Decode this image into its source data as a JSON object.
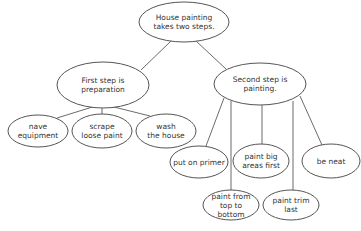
{
  "diagram": {
    "type": "concept-map",
    "colors": {
      "stroke": "#555555",
      "text": "#333333",
      "background": "#ffffff"
    },
    "nodes": [
      {
        "id": "root",
        "label": "House painting\ntakes two steps.",
        "cx": 184,
        "cy": 22,
        "rx": 45,
        "ry": 20
      },
      {
        "id": "prep",
        "label": "First step is preparation",
        "cx": 103,
        "cy": 85,
        "rx": 46,
        "ry": 23
      },
      {
        "id": "paint",
        "label": "Second step is painting.",
        "cx": 260,
        "cy": 84,
        "rx": 46,
        "ry": 21
      },
      {
        "id": "equip",
        "label": "nave\nequipment",
        "cx": 38,
        "cy": 131,
        "rx": 30,
        "ry": 16
      },
      {
        "id": "scrape",
        "label": "scrape\nloose paint",
        "cx": 102,
        "cy": 131,
        "rx": 30,
        "ry": 17
      },
      {
        "id": "wash",
        "label": "wash\nthe house",
        "cx": 166,
        "cy": 131,
        "rx": 30,
        "ry": 17
      },
      {
        "id": "primer",
        "label": "put on primer",
        "cx": 199,
        "cy": 162,
        "rx": 29,
        "ry": 16
      },
      {
        "id": "big",
        "label": "paint big\nareas first",
        "cx": 261,
        "cy": 161,
        "rx": 28,
        "ry": 17
      },
      {
        "id": "neat",
        "label": "be neat",
        "cx": 331,
        "cy": 161,
        "rx": 29,
        "ry": 17
      },
      {
        "id": "top",
        "label": "paint from\ntop to bottom",
        "cx": 231,
        "cy": 205,
        "rx": 28,
        "ry": 15
      },
      {
        "id": "trim",
        "label": "paint trim\nlast",
        "cx": 291,
        "cy": 205,
        "rx": 28,
        "ry": 15
      }
    ],
    "edges": [
      {
        "from": "root",
        "to": "prep",
        "x1": 171,
        "y1": 41,
        "x2": 141,
        "y2": 70
      },
      {
        "from": "root",
        "to": "paint",
        "x1": 196,
        "y1": 41,
        "x2": 226,
        "y2": 69
      },
      {
        "from": "prep",
        "to": "equip",
        "x1": 102,
        "y1": 104,
        "x2": 57,
        "y2": 118
      },
      {
        "from": "prep",
        "to": "scrape",
        "x1": 102,
        "y1": 104,
        "x2": 102,
        "y2": 114
      },
      {
        "from": "prep",
        "to": "wash",
        "x1": 102,
        "y1": 104,
        "x2": 150,
        "y2": 116
      },
      {
        "from": "paint",
        "to": "primer",
        "x1": 224,
        "y1": 98,
        "x2": 206,
        "y2": 146
      },
      {
        "from": "paint",
        "to": "top",
        "x1": 231,
        "y1": 101,
        "x2": 231,
        "y2": 190
      },
      {
        "from": "paint",
        "to": "big",
        "x1": 262,
        "y1": 105,
        "x2": 262,
        "y2": 144
      },
      {
        "from": "paint",
        "to": "trim",
        "x1": 293,
        "y1": 101,
        "x2": 293,
        "y2": 190
      },
      {
        "from": "paint",
        "to": "neat",
        "x1": 300,
        "y1": 96,
        "x2": 322,
        "y2": 145
      }
    ]
  }
}
